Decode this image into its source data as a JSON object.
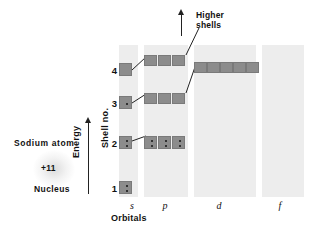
{
  "figure": {
    "atom": {
      "name": "Sodium  atom",
      "charge": "+11",
      "nucleus": "Nucleus"
    },
    "axes": {
      "energy_label": "Energy",
      "shell_label": "Shell no.",
      "orbitals_caption": "Orbitals"
    },
    "annotation": {
      "higher_shells_line1": "Higher",
      "higher_shells_line2": "shells"
    },
    "orbital_labels": [
      {
        "name": "s",
        "x": 127,
        "width": 10
      },
      {
        "name": "p",
        "x": 160,
        "width": 10
      },
      {
        "name": "d",
        "x": 214,
        "width": 10
      },
      {
        "name": "f",
        "x": 275,
        "width": 10
      }
    ],
    "shell_numbers": [
      {
        "label": "1",
        "x": 107,
        "y": 183
      },
      {
        "label": "2",
        "x": 107,
        "y": 138
      },
      {
        "label": "3",
        "x": 107,
        "y": 98
      },
      {
        "label": "4",
        "x": 107,
        "y": 65
      }
    ],
    "bands": [
      {
        "orbital": "s",
        "x": 119,
        "y": 45,
        "width": 19,
        "height": 152,
        "color": "#ededed"
      },
      {
        "orbital": "p",
        "x": 144,
        "y": 45,
        "width": 44,
        "height": 152,
        "color": "#ededed"
      },
      {
        "orbital": "d",
        "x": 194,
        "y": 45,
        "width": 62,
        "height": 152,
        "color": "#ededed"
      },
      {
        "orbital": "f",
        "x": 233,
        "y": 45,
        "width": 0,
        "height": 0,
        "color": "#ededed"
      }
    ],
    "bands_render": [
      {
        "orbital": "s",
        "x": 119,
        "y": 45,
        "width": 19,
        "height": 152
      },
      {
        "orbital": "p",
        "x": 144,
        "y": 45,
        "width": 44,
        "height": 152
      },
      {
        "orbital": "d",
        "x": 194,
        "y": 45,
        "width": 62,
        "height": 152
      },
      {
        "orbital": "f",
        "x": 262,
        "y": 45,
        "width": 42,
        "height": 152
      }
    ],
    "boxes": [
      {
        "id": "s1",
        "orbital": "s",
        "shell": 1,
        "x": 119,
        "y": 181,
        "w": 13,
        "h": 13,
        "electrons": 2
      },
      {
        "id": "s2",
        "orbital": "s",
        "shell": 2,
        "x": 119,
        "y": 136,
        "w": 13,
        "h": 13,
        "electrons": 2
      },
      {
        "id": "p2a",
        "orbital": "p",
        "shell": 2,
        "x": 144,
        "y": 136,
        "w": 13,
        "h": 13,
        "electrons": 2
      },
      {
        "id": "p2b",
        "orbital": "p",
        "shell": 2,
        "x": 158,
        "y": 136,
        "w": 13,
        "h": 13,
        "electrons": 2
      },
      {
        "id": "p2c",
        "orbital": "p",
        "shell": 2,
        "x": 172,
        "y": 136,
        "w": 13,
        "h": 13,
        "electrons": 2
      },
      {
        "id": "s3",
        "orbital": "s",
        "shell": 3,
        "x": 119,
        "y": 96,
        "w": 13,
        "h": 13,
        "electrons": 1
      },
      {
        "id": "p3a",
        "orbital": "p",
        "shell": 3,
        "x": 144,
        "y": 93,
        "w": 13,
        "h": 11,
        "electrons": 0
      },
      {
        "id": "p3b",
        "orbital": "p",
        "shell": 3,
        "x": 158,
        "y": 93,
        "w": 13,
        "h": 11,
        "electrons": 0
      },
      {
        "id": "p3c",
        "orbital": "p",
        "shell": 3,
        "x": 172,
        "y": 93,
        "w": 13,
        "h": 11,
        "electrons": 0
      },
      {
        "id": "s4",
        "orbital": "s",
        "shell": 4,
        "x": 119,
        "y": 63,
        "w": 13,
        "h": 13,
        "electrons": 0
      },
      {
        "id": "p4a",
        "orbital": "p",
        "shell": 4,
        "x": 144,
        "y": 55,
        "w": 13,
        "h": 11,
        "electrons": 0
      },
      {
        "id": "p4b",
        "orbital": "p",
        "shell": 4,
        "x": 158,
        "y": 55,
        "w": 13,
        "h": 11,
        "electrons": 0
      },
      {
        "id": "p4c",
        "orbital": "p",
        "shell": 4,
        "x": 172,
        "y": 55,
        "w": 13,
        "h": 11,
        "electrons": 0
      },
      {
        "id": "d4a",
        "orbital": "d",
        "shell": 4,
        "x": 194,
        "y": 62,
        "w": 13,
        "h": 11,
        "electrons": 0
      },
      {
        "id": "d4b",
        "orbital": "d",
        "shell": 4,
        "x": 207,
        "y": 62,
        "w": 13,
        "h": 11,
        "electrons": 0
      },
      {
        "id": "d4c",
        "orbital": "d",
        "shell": 4,
        "x": 220,
        "y": 62,
        "w": 13,
        "h": 11,
        "electrons": 0
      },
      {
        "id": "d4d",
        "orbital": "d",
        "shell": 4,
        "x": 233,
        "y": 62,
        "w": 13,
        "h": 11,
        "electrons": 0
      },
      {
        "id": "d4e",
        "orbital": "d",
        "shell": 4,
        "x": 246,
        "y": 62,
        "w": 13,
        "h": 11,
        "electrons": 0
      }
    ],
    "connectors": [
      {
        "from": "s2",
        "to": "p2",
        "x1": 132,
        "y1": 141,
        "x2": 146,
        "y2": 136
      },
      {
        "from": "s3",
        "to": "p3",
        "x1": 132,
        "y1": 103,
        "x2": 146,
        "y2": 94
      },
      {
        "from": "s4",
        "to": "p4",
        "x1": 132,
        "y1": 70,
        "x2": 146,
        "y2": 57
      },
      {
        "from": "p3",
        "to": "d4",
        "x1": 186,
        "y1": 93,
        "x2": 196,
        "y2": 64
      },
      {
        "from": "p4",
        "to": "higher",
        "x1": 186,
        "y1": 55,
        "x2": 199,
        "y2": 28
      }
    ],
    "colors": {
      "band": "#ededed",
      "box": "#8c8c8c",
      "electron": "#141414",
      "ink": "#111111"
    }
  }
}
